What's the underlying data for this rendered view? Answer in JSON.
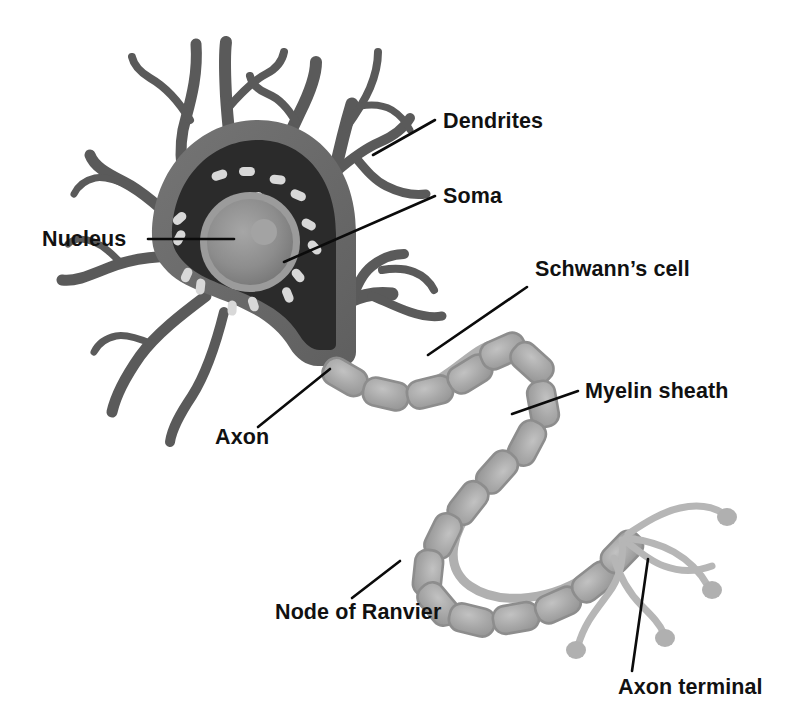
{
  "figure": {
    "background_color": "#ffffff"
  },
  "palette": {
    "dendrite_gray": "#5a5a5a",
    "soma_membrane_gray": "#6e6e6e",
    "cytoplasm_dark": "#2b2b2b",
    "nucleus_gray": "#8e8e8e",
    "nucleus_inner_gray": "#7b7b7b",
    "nucleolus_gray": "#9a9a9a",
    "rough_er_light": "#d8d8d8",
    "myelin_fill": "#a9a9a9",
    "myelin_outline": "#8a8a8a",
    "axon_terminal_gray": "#b4b4b4",
    "leader_line_black": "#0b0b0b",
    "label_text_black": "#111111"
  },
  "labels": [
    {
      "id": "dendrites",
      "text": "Dendrites",
      "x": 443,
      "y": 128,
      "anchor": "start",
      "leader": "M 373,155 L 435,120"
    },
    {
      "id": "soma",
      "text": "Soma",
      "x": 443,
      "y": 203,
      "anchor": "start",
      "leader": "M 284,262 L 435,196"
    },
    {
      "id": "nucleus",
      "text": "Nucleus",
      "x": 42,
      "y": 246,
      "anchor": "start",
      "leader": "M 148,239 L 234,239"
    },
    {
      "id": "schwanns-cell",
      "text": "Schwann’s cell",
      "x": 535,
      "y": 276,
      "anchor": "start",
      "leader": "M 428,355 L 527,287"
    },
    {
      "id": "myelin-sheath",
      "text": "Myelin sheath",
      "x": 585,
      "y": 398,
      "anchor": "start",
      "leader": "M 512,414 L 578,391"
    },
    {
      "id": "axon",
      "text": "Axon",
      "x": 215,
      "y": 444,
      "anchor": "start",
      "leader": "M 330,369 L 258,427"
    },
    {
      "id": "node-of-ranvier",
      "text": "Node of Ranvier",
      "x": 275,
      "y": 619,
      "anchor": "start",
      "leader": "M 400,561 L 352,598"
    },
    {
      "id": "axon-terminal",
      "text": "Axon terminal",
      "x": 618,
      "y": 694,
      "anchor": "start",
      "leader": "M 648,559 L 632,671"
    }
  ],
  "parts": {
    "dendrite_count": 13,
    "myelin_segment_count": 24,
    "axon_terminal_branch_count": 4,
    "rough_er_granule_count": 16
  }
}
